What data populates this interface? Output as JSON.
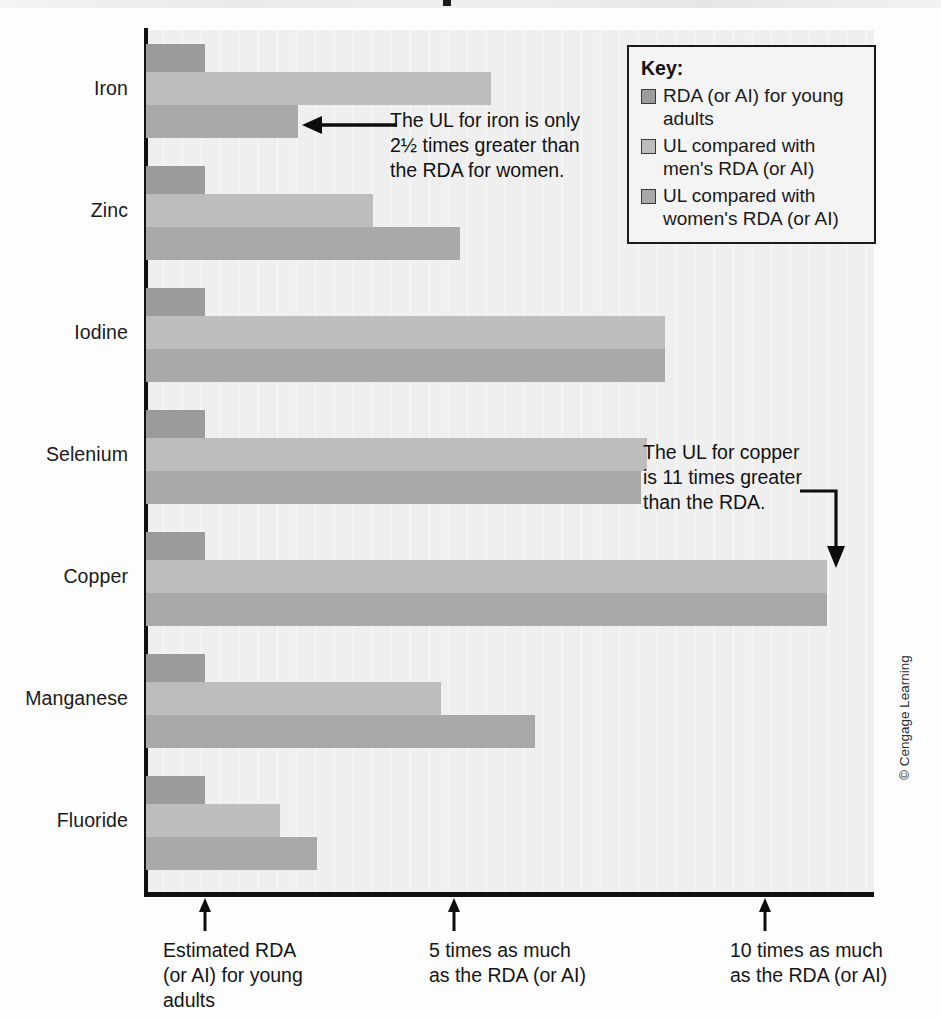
{
  "credit": "© Cengage Learning",
  "key": {
    "title": "Key:",
    "items": [
      {
        "swatch": "rda",
        "label": "RDA (or AI)\nfor young adults"
      },
      {
        "swatch": "ulm",
        "label": "UL compared with\nmen's RDA (or AI)"
      },
      {
        "swatch": "ulw",
        "label": "UL compared with\nwomen's RDA (or AI)"
      }
    ]
  },
  "annotations": {
    "iron": "The UL for iron is only\n2½ times greater than\nthe RDA for women.",
    "copper": "The UL for copper\nis 11 times greater\nthan the RDA."
  },
  "axis_ticks": [
    {
      "value": 1,
      "label": "Estimated RDA\n(or AI) for young\nadults"
    },
    {
      "value": 5,
      "label": "5 times as much\nas the RDA (or AI)"
    },
    {
      "value": 10,
      "label": "10 times as much\nas the RDA (or AI)"
    }
  ],
  "colors": {
    "rda": "#9b9b9b",
    "ul_men": "#bdbdbd",
    "ul_women": "#a9a9a9",
    "axis": "#111111",
    "plot_background": "#efefef"
  },
  "chart_data": {
    "type": "bar",
    "orientation": "horizontal",
    "title": "",
    "xlabel": "Multiples of the RDA (or AI)",
    "ylabel": "",
    "xlim": [
      0,
      11.6
    ],
    "grid": false,
    "legend_position": "top-right",
    "categories": [
      "Iron",
      "Zinc",
      "Iodine",
      "Selenium",
      "Copper",
      "Manganese",
      "Fluoride"
    ],
    "series": [
      {
        "name": "RDA (or AI) for young adults",
        "key": "rda",
        "values": [
          1,
          1,
          1,
          1,
          1,
          1,
          1
        ]
      },
      {
        "name": "UL compared with men's RDA (or AI)",
        "key": "ul_men",
        "values": [
          5.6,
          3.7,
          8.4,
          8.1,
          11.0,
          4.8,
          2.2
        ]
      },
      {
        "name": "UL compared with women's RDA (or AI)",
        "key": "ul_women",
        "values": [
          2.5,
          5.1,
          8.4,
          8.0,
          11.0,
          6.3,
          2.8
        ]
      }
    ],
    "notes": [
      "The UL for iron is only 2½ times greater than the RDA for women.",
      "The UL for copper is 11 times greater than the RDA."
    ]
  }
}
